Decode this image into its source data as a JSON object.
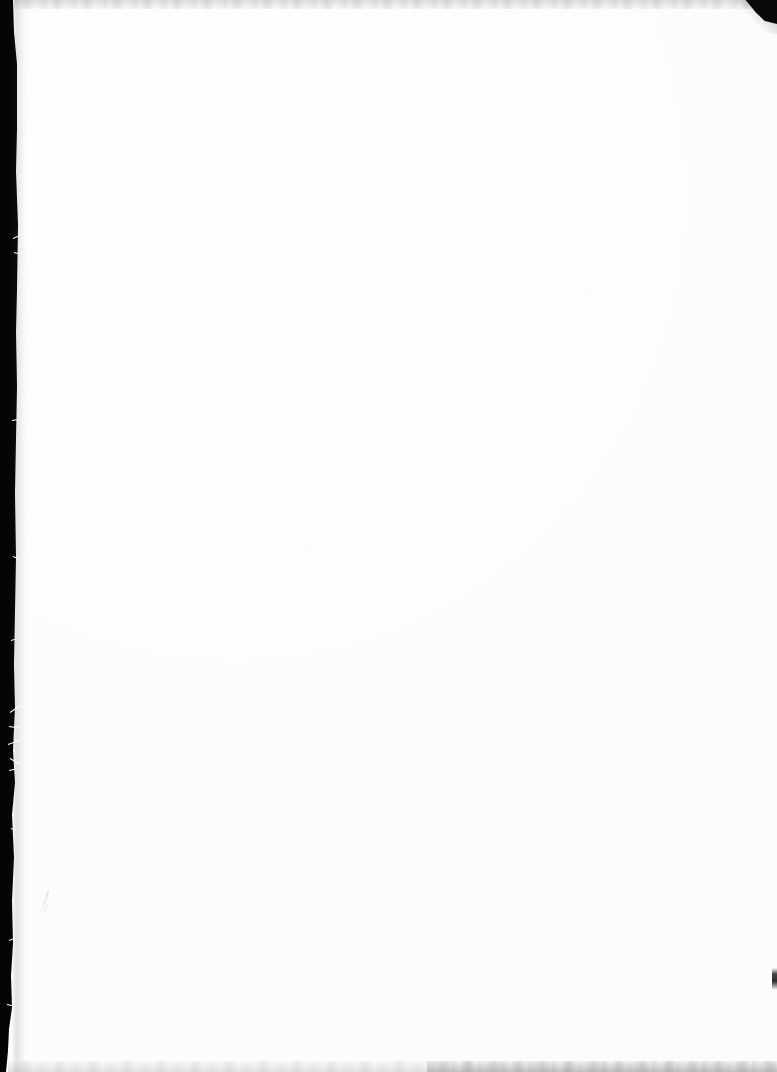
{
  "document": {
    "type": "scanned-page",
    "title": "Scanned blank page",
    "page_label": "",
    "content_text": "",
    "has_text": false,
    "orientation": "portrait",
    "width_px": 777,
    "height_px": 1072
  },
  "colors": {
    "paper": "#fefefe",
    "gutter": "#050505",
    "corner_clip": "#0a0a0a",
    "edge_band": "#b4b4b4",
    "pen_mark": "#e8e8e8",
    "fiber": "#ffffff"
  },
  "artifacts": {
    "left_gutter": {
      "name": "scanner-gutter",
      "edge": "left",
      "width_top_px": 13,
      "width_middle_px": 17,
      "width_bottom_px": 6,
      "color": "#050505"
    },
    "corner_clip": {
      "name": "clipped-corner",
      "edge": "top-right",
      "width_px": 32,
      "height_px": 24,
      "color": "#0a0a0a"
    },
    "top_band": {
      "name": "scan-band-top",
      "height_px": 9,
      "tone": "faint-grey-streaks"
    },
    "bottom_band": {
      "name": "scan-band-bottom",
      "height_px": 11,
      "tone": "faint-grey-streaks"
    },
    "edge_nick": {
      "name": "edge-nick",
      "edge": "right",
      "top_px": 968,
      "height_px": 22
    },
    "pen_mark": {
      "name": "pen-stroke",
      "x_px": 45,
      "y_px": 893,
      "length_px": 21,
      "angle_deg": 19,
      "color": "#e8e8e8"
    },
    "fibers": [
      {
        "x": 13,
        "y": 238,
        "len": 9,
        "angle": -24
      },
      {
        "x": 14,
        "y": 252,
        "len": 7,
        "angle": 14
      },
      {
        "x": 12,
        "y": 420,
        "len": 5,
        "angle": -8
      },
      {
        "x": 13,
        "y": 556,
        "len": 6,
        "angle": 22
      },
      {
        "x": 11,
        "y": 640,
        "len": 5,
        "angle": -16
      },
      {
        "x": 10,
        "y": 712,
        "len": 13,
        "angle": -34
      },
      {
        "x": 9,
        "y": 726,
        "len": 10,
        "angle": 8
      },
      {
        "x": 8,
        "y": 744,
        "len": 14,
        "angle": -20
      },
      {
        "x": 10,
        "y": 758,
        "len": 11,
        "angle": 30
      },
      {
        "x": 9,
        "y": 770,
        "len": 8,
        "angle": -12
      },
      {
        "x": 11,
        "y": 828,
        "len": 6,
        "angle": 18
      },
      {
        "x": 9,
        "y": 940,
        "len": 7,
        "angle": -22
      },
      {
        "x": 7,
        "y": 1004,
        "len": 6,
        "angle": 12
      }
    ],
    "specks": [
      {
        "x": 90,
        "y": 36,
        "size": 2
      },
      {
        "x": 200,
        "y": 44,
        "size": 2
      },
      {
        "x": 338,
        "y": 66,
        "size": 2
      },
      {
        "x": 436,
        "y": 290,
        "size": 2
      },
      {
        "x": 588,
        "y": 292,
        "size": 3
      },
      {
        "x": 222,
        "y": 430,
        "size": 2
      },
      {
        "x": 304,
        "y": 545,
        "size": 2
      },
      {
        "x": 640,
        "y": 560,
        "size": 2
      },
      {
        "x": 426,
        "y": 632,
        "size": 2
      },
      {
        "x": 172,
        "y": 718,
        "size": 2
      },
      {
        "x": 578,
        "y": 826,
        "size": 2
      },
      {
        "x": 708,
        "y": 880,
        "size": 2
      },
      {
        "x": 396,
        "y": 962,
        "size": 2
      },
      {
        "x": 264,
        "y": 1020,
        "size": 2
      }
    ]
  }
}
